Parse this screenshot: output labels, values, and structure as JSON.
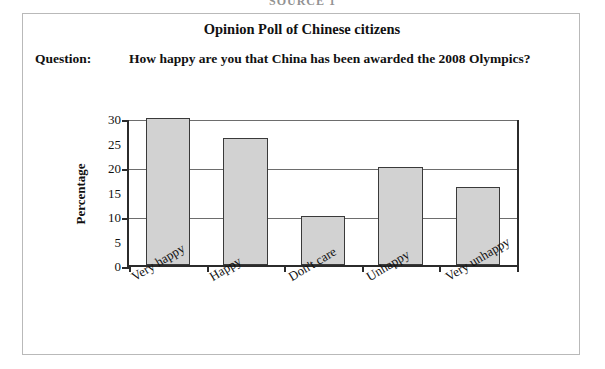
{
  "source_caption": "SOURCE 1",
  "figure": {
    "title": "Opinion Poll of Chinese citizens",
    "question_label": "Question:",
    "question_text": "How happy are you that China has been awarded the 2008 Olympics?"
  },
  "chart_data": {
    "type": "bar",
    "title": "Opinion Poll of Chinese citizens",
    "categories": [
      "Very happy",
      "Happy",
      "Don't care",
      "Unhappy",
      "Very unhappy"
    ],
    "values": [
      30,
      26,
      10,
      20,
      16
    ],
    "xlabel": "",
    "ylabel": "Percentage",
    "ylim": [
      0,
      30
    ],
    "ytick_labels": [
      "0",
      "5",
      "10",
      "15",
      "20",
      "25",
      "30"
    ],
    "ytick_values": [
      0,
      5,
      10,
      15,
      20,
      25,
      30
    ],
    "gridlines_at": [
      10,
      20,
      30
    ],
    "major_ticks_at": [
      0,
      10,
      20,
      30
    ],
    "grid": true,
    "legend": "none",
    "bar_fill_color": "#d2d2d2",
    "bar_edge_color": "#3a3a3a",
    "axis_color": "#2b2b2b",
    "xlabel_rotation_degrees": -31
  }
}
